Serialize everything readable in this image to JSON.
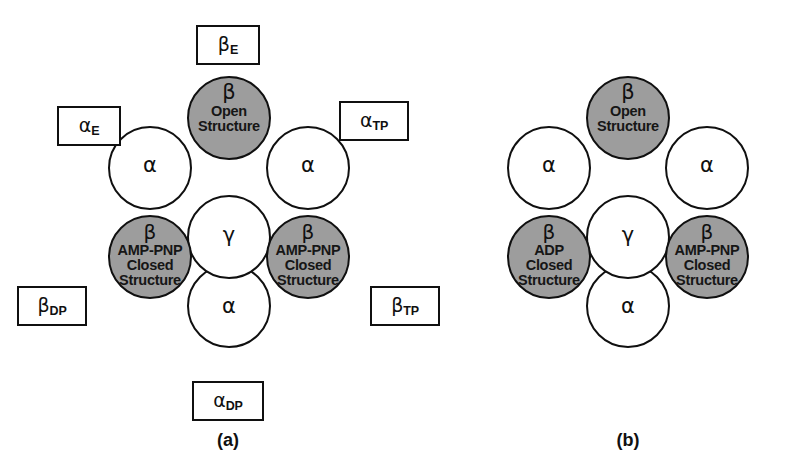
{
  "figure": {
    "colors": {
      "beta_fill": "#9d9d9d",
      "alpha_fill": "#ffffff",
      "gamma_fill": "#ffffff",
      "outline": "#101010",
      "background": "#ffffff"
    }
  },
  "panel_a": {
    "caption": "(a)",
    "circles": {
      "beta_top": {
        "greek": "β",
        "line1": "Open",
        "line2": "Structure",
        "shade": "dark"
      },
      "alpha_left": {
        "greek": "α"
      },
      "alpha_right": {
        "greek": "α"
      },
      "gamma_center": {
        "greek": "γ"
      },
      "beta_lower_left": {
        "greek": "β",
        "line1": "AMP-PNP",
        "line2": "Closed",
        "line3": "Structure",
        "shade": "dark"
      },
      "beta_lower_right": {
        "greek": "β",
        "line1": "AMP-PNP",
        "line2": "Closed",
        "line3": "Structure",
        "shade": "dark"
      },
      "alpha_bottom": {
        "greek": "α"
      }
    },
    "tags": {
      "beta_E": {
        "symbol": "β",
        "subscript": "E"
      },
      "alpha_E": {
        "symbol": "α",
        "subscript": "E"
      },
      "alpha_TP": {
        "symbol": "α",
        "subscript": "TP"
      },
      "beta_DP": {
        "symbol": "β",
        "subscript": "DP"
      },
      "beta_TP": {
        "symbol": "β",
        "subscript": "TP"
      },
      "alpha_DP": {
        "symbol": "α",
        "subscript": "DP"
      }
    }
  },
  "panel_b": {
    "caption": "(b)",
    "circles": {
      "beta_top": {
        "greek": "β",
        "line1": "Open",
        "line2": "Structure",
        "shade": "dark"
      },
      "alpha_left": {
        "greek": "α"
      },
      "alpha_right": {
        "greek": "α"
      },
      "gamma_center": {
        "greek": "γ"
      },
      "beta_lower_left": {
        "greek": "β",
        "line1": "ADP",
        "line2": "Closed",
        "line3": "Structure",
        "shade": "dark"
      },
      "beta_lower_right": {
        "greek": "β",
        "line1": "AMP-PNP",
        "line2": "Closed",
        "line3": "Structure",
        "shade": "dark"
      },
      "alpha_bottom": {
        "greek": "α"
      }
    }
  }
}
